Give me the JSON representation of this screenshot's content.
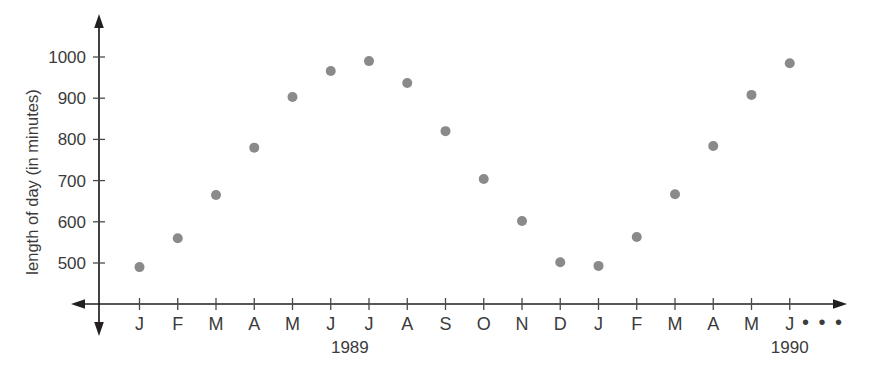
{
  "chart_data": {
    "type": "scatter",
    "title": "",
    "xlabel": "",
    "ylabel": "length of day (in minutes)",
    "grid": false,
    "legend": null,
    "ylim": [
      430,
      1045
    ],
    "y_ticks": [
      500,
      600,
      700,
      800,
      900,
      1000
    ],
    "y_tick_labels": [
      "500",
      "600",
      "700",
      "800",
      "900",
      "1000"
    ],
    "x_tick_labels": [
      "J",
      "F",
      "M",
      "A",
      "M",
      "J",
      "J",
      "A",
      "S",
      "O",
      "N",
      "D",
      "J",
      "F",
      "M",
      "A",
      "M",
      "J"
    ],
    "x_group_labels": [
      {
        "text": "1989",
        "center_index": 5.5
      },
      {
        "text": "1990",
        "center_index": 17
      }
    ],
    "x_axis_continuation": "• • •",
    "categories": [
      "Jan 1989",
      "Feb 1989",
      "Mar 1989",
      "Apr 1989",
      "May 1989",
      "Jun 1989",
      "Jul 1989",
      "Aug 1989",
      "Sep 1989",
      "Oct 1989",
      "Nov 1989",
      "Dec 1989",
      "Jan 1990",
      "Feb 1990",
      "Mar 1990",
      "Apr 1990",
      "May 1990",
      "Jun 1990"
    ],
    "values": [
      490,
      560,
      665,
      780,
      903,
      966,
      990,
      937,
      820,
      704,
      602,
      502,
      493,
      563,
      667,
      784,
      908,
      985
    ],
    "marker": {
      "shape": "circle",
      "color": "#8a8a8a",
      "size_px": 10
    }
  },
  "colors": {
    "axis": "#231f20",
    "text": "#3b3b3b",
    "marker": "#8a8a8a",
    "background": "#ffffff"
  }
}
